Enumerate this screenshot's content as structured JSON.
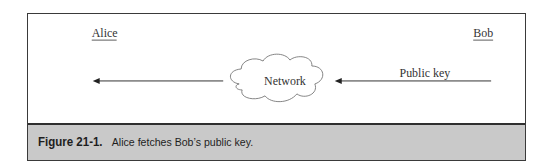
{
  "diagram": {
    "parties": [
      {
        "id": "alice",
        "label": "Alice"
      },
      {
        "id": "bob",
        "label": "Bob"
      }
    ],
    "network": {
      "label": "Network"
    },
    "arrows": [
      {
        "from": "bob",
        "to": "network",
        "label": "Public key"
      },
      {
        "from": "network",
        "to": "alice",
        "label": ""
      }
    ]
  },
  "caption": {
    "number": "Figure 21-1.",
    "text": "Alice fetches Bob’s public key."
  },
  "colors": {
    "border": "#3a3a3a",
    "caption_bg": "#c9c9c9",
    "text": "#333333"
  }
}
